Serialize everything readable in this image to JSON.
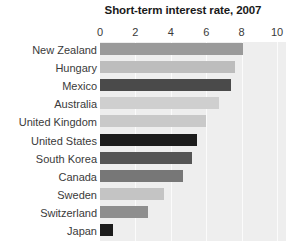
{
  "chart_data": {
    "type": "bar",
    "orientation": "horizontal",
    "title": "Short-term interest rate, 2007",
    "xlabel": "",
    "ylabel": "",
    "xlim": [
      0,
      10
    ],
    "xticks": [
      0,
      2,
      4,
      6,
      8,
      10
    ],
    "xtick_labels": [
      "0",
      "2",
      "4",
      "6",
      "8",
      "10"
    ],
    "grid": true,
    "grid_axis": "x",
    "legend": false,
    "plot_background": "#eeeeee",
    "categories": [
      "New Zealand",
      "Hungary",
      "Mexico",
      "Australia",
      "United Kingdom",
      "United States",
      "South Korea",
      "Canada",
      "Sweden",
      "Switzerland",
      "Japan"
    ],
    "values": [
      8.1,
      7.6,
      7.4,
      6.7,
      6.0,
      5.5,
      5.2,
      4.7,
      3.6,
      2.7,
      0.75
    ],
    "bar_colors": [
      "#9a9a9a",
      "#bdbdbd",
      "#4a4a4a",
      "#cfcfcf",
      "#c9c9c9",
      "#1c1c1c",
      "#555555",
      "#777777",
      "#c4c4c4",
      "#8e8e8e",
      "#1c1c1c"
    ],
    "bars": [
      {
        "label": "New Zealand",
        "value": 8.1,
        "color": "#9a9a9a"
      },
      {
        "label": "Hungary",
        "value": 7.6,
        "color": "#bdbdbd"
      },
      {
        "label": "Mexico",
        "value": 7.4,
        "color": "#4a4a4a"
      },
      {
        "label": "Australia",
        "value": 6.7,
        "color": "#cfcfcf"
      },
      {
        "label": "United Kingdom",
        "value": 6.0,
        "color": "#c9c9c9"
      },
      {
        "label": "United States",
        "value": 5.5,
        "color": "#1c1c1c"
      },
      {
        "label": "South Korea",
        "value": 5.2,
        "color": "#555555"
      },
      {
        "label": "Canada",
        "value": 4.7,
        "color": "#777777"
      },
      {
        "label": "Sweden",
        "value": 3.6,
        "color": "#c4c4c4"
      },
      {
        "label": "Switzerland",
        "value": 2.7,
        "color": "#8e8e8e"
      },
      {
        "label": "Japan",
        "value": 0.75,
        "color": "#1c1c1c"
      }
    ]
  }
}
